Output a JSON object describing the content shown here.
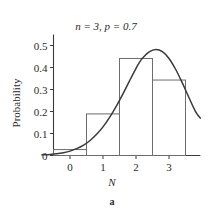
{
  "figure": {
    "caption": "a",
    "title": "n = 3, p = 0.7",
    "title_parts": {
      "n_symbol": "n",
      "n_value": "3",
      "p_symbol": "p",
      "p_value": "0.7"
    }
  },
  "chart_data": {
    "type": "bar",
    "title": "n = 3, p = 0.7",
    "xlabel": "N",
    "ylabel": "Probability",
    "categories": [
      "0",
      "1",
      "2",
      "3"
    ],
    "x": [
      0,
      1,
      2,
      3
    ],
    "values": [
      0.027,
      0.189,
      0.441,
      0.343
    ],
    "bar_width": 1,
    "bar_edges": [
      [
        -0.5,
        0.5
      ],
      [
        0.5,
        1.5
      ],
      [
        1.5,
        2.5
      ],
      [
        2.5,
        3.5
      ]
    ],
    "xlim": [
      -0.85,
      3.95
    ],
    "ylim": [
      0,
      0.55
    ],
    "xticks": [
      0,
      1,
      2,
      3
    ],
    "xtick_labels": [
      "0",
      "1",
      "2",
      "3"
    ],
    "yticks": [
      0,
      0.1,
      0.2,
      0.3,
      0.4,
      0.5
    ],
    "ytick_labels": [
      "0",
      "0.1",
      "0.2",
      "0.3",
      "0.4",
      "0.5"
    ],
    "grid": false,
    "legend": null,
    "overlay": {
      "type": "line",
      "name": "normal approximation curve",
      "mean": 2.1,
      "sigma": 0.794,
      "peak_value": 0.5,
      "peak_x": 2.1,
      "samples_x": [
        -0.85,
        -0.6,
        -0.4,
        -0.2,
        0.0,
        0.2,
        0.4,
        0.6,
        0.8,
        1.0,
        1.2,
        1.4,
        1.6,
        1.8,
        2.0,
        2.1,
        2.2,
        2.4,
        2.6,
        2.8,
        3.0,
        3.2,
        3.4,
        3.6,
        3.8,
        3.95
      ],
      "samples_y": [
        0.003,
        0.005,
        0.008,
        0.013,
        0.02,
        0.031,
        0.046,
        0.067,
        0.095,
        0.13,
        0.173,
        0.223,
        0.279,
        0.338,
        0.396,
        0.422,
        0.443,
        0.471,
        0.482,
        0.472,
        0.441,
        0.392,
        0.331,
        0.265,
        0.201,
        0.17
      ]
    },
    "colors": {
      "bar_stroke": "#6d6d6d",
      "curve_stroke": "#3a3a3a",
      "axis": "#3a3a3a",
      "text": "#2b2b2b",
      "background": "#ffffff"
    }
  }
}
